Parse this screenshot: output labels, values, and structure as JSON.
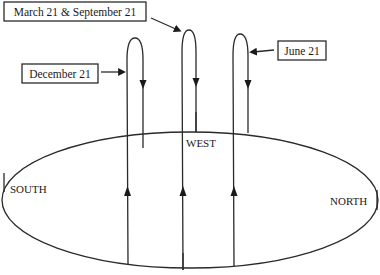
{
  "diagram": {
    "labels": {
      "march_september": "March 21 & September 21",
      "december": "December 21",
      "june": "June 21",
      "west": "WEST",
      "south": "SOUTH",
      "north": "NORTH"
    },
    "paths": [
      {
        "name": "December 21",
        "description": "lowest/southernmost path"
      },
      {
        "name": "March 21 & September 21",
        "description": "equinox path, middle"
      },
      {
        "name": "June 21",
        "description": "northernmost path"
      }
    ],
    "colors": {
      "line": "#2a2a2a",
      "background": "#ffffff"
    }
  }
}
